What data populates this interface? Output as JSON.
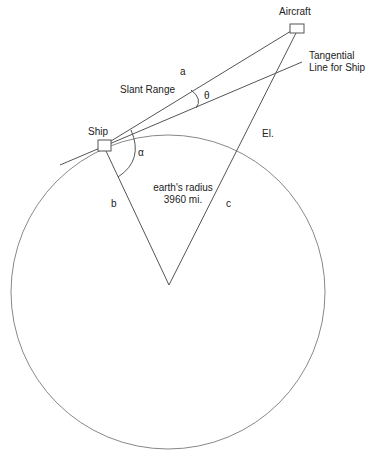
{
  "diagram": {
    "labels": {
      "aircraft": "Aircraft",
      "tangential_line_1": "Tangential",
      "tangential_line_2": "Line for Ship",
      "a": "a",
      "slant_range": "Slant Range",
      "theta": "θ",
      "el": "El.",
      "ship": "Ship",
      "alpha": "α",
      "earths_radius": "earth's radius",
      "radius_value": "3960 mi.",
      "b": "b",
      "c": "c"
    },
    "colors": {
      "line": "#555555",
      "circle": "#888888",
      "text": "#222222"
    }
  }
}
